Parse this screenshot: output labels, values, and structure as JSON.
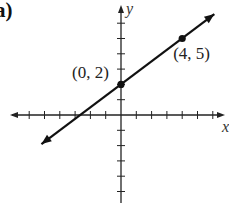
{
  "panel_label": "a)",
  "chart_data": {
    "type": "line",
    "title": "",
    "xlabel": "x",
    "ylabel": "y",
    "xlim": [
      -6,
      6
    ],
    "ylim": [
      -5,
      6
    ],
    "grid": false,
    "x_ticks": [
      -6,
      -5,
      -4,
      -3,
      -2,
      -1,
      0,
      1,
      2,
      3,
      4,
      5,
      6
    ],
    "y_ticks": [
      -5,
      -4,
      -3,
      -2,
      -1,
      0,
      1,
      2,
      3,
      4,
      5,
      6
    ],
    "series": [
      {
        "name": "line",
        "x": [
          -5.2,
          6.1
        ],
        "y": [
          -1.9,
          6.6
        ],
        "slope": 0.75,
        "intercept": 2,
        "arrows_both_ends": true
      }
    ],
    "points": [
      {
        "x": 0,
        "y": 2,
        "label": "(0, 2)"
      },
      {
        "x": 4,
        "y": 5,
        "label": "(4, 5)"
      }
    ]
  }
}
